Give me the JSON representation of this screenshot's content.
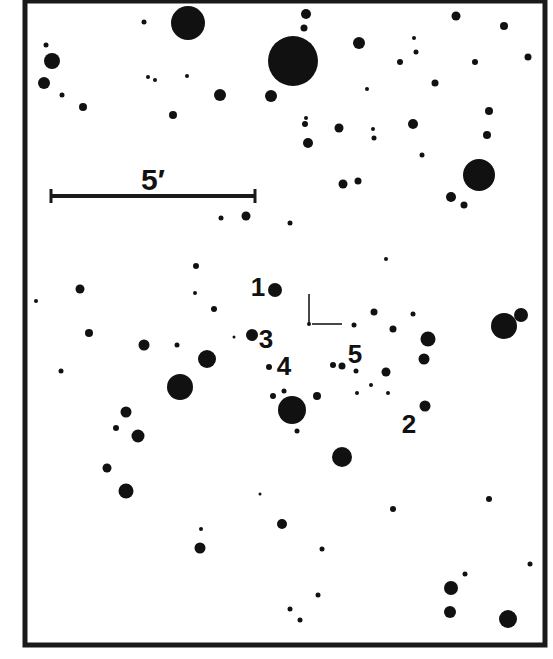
{
  "chart": {
    "type": "finding-chart",
    "frame": {
      "x": 25,
      "y": 1,
      "width": 520,
      "height": 644,
      "stroke": "#1a1a1a",
      "stroke_width": 5
    },
    "scale_bar": {
      "x1": 51,
      "x2": 255,
      "y": 196,
      "label": "5′",
      "label_x": 153,
      "label_y": 190
    },
    "target_marker": {
      "x": 309,
      "y": 324,
      "vertical_len": 30,
      "horizontal_len": 33
    },
    "labels": [
      {
        "text": "1",
        "x": 258,
        "y": 296
      },
      {
        "text": "3",
        "x": 266,
        "y": 348
      },
      {
        "text": "4",
        "x": 284,
        "y": 375
      },
      {
        "text": "5",
        "x": 355,
        "y": 363
      },
      {
        "text": "2",
        "x": 409,
        "y": 433
      }
    ],
    "star_color": "#111111",
    "stars": [
      [
        188,
        23,
        17
      ],
      [
        144,
        22,
        2.5
      ],
      [
        306,
        14,
        5
      ],
      [
        304,
        28,
        3.5
      ],
      [
        293,
        61,
        25
      ],
      [
        46,
        45,
        2.5
      ],
      [
        52,
        61,
        8
      ],
      [
        44,
        83,
        6
      ],
      [
        62,
        95,
        2.5
      ],
      [
        83,
        107,
        4
      ],
      [
        148,
        77,
        2
      ],
      [
        155,
        80,
        2
      ],
      [
        187,
        76,
        2
      ],
      [
        220,
        95,
        6
      ],
      [
        173,
        115,
        4
      ],
      [
        271,
        96,
        6
      ],
      [
        359,
        43,
        6
      ],
      [
        456,
        16,
        4.5
      ],
      [
        504,
        26,
        4
      ],
      [
        414,
        38,
        2
      ],
      [
        416,
        52,
        2.5
      ],
      [
        400,
        62,
        3
      ],
      [
        475,
        62,
        3
      ],
      [
        528,
        57,
        3.5
      ],
      [
        435,
        83,
        3.5
      ],
      [
        367,
        89,
        2
      ],
      [
        306,
        118,
        2
      ],
      [
        305,
        124,
        3
      ],
      [
        339,
        128,
        4.5
      ],
      [
        308,
        143,
        5
      ],
      [
        373,
        129,
        2
      ],
      [
        374,
        138,
        2.5
      ],
      [
        413,
        124,
        5
      ],
      [
        489,
        111,
        4
      ],
      [
        487,
        135,
        4
      ],
      [
        422,
        155,
        2.5
      ],
      [
        479,
        175,
        16
      ],
      [
        451,
        197,
        5
      ],
      [
        464,
        205,
        3.5
      ],
      [
        343,
        184,
        4.5
      ],
      [
        358,
        181,
        3.5
      ],
      [
        221,
        218,
        2.5
      ],
      [
        246,
        216,
        4.5
      ],
      [
        290,
        223,
        2.5
      ],
      [
        196,
        266,
        3
      ],
      [
        80,
        289,
        4.5
      ],
      [
        36,
        301,
        2
      ],
      [
        195,
        293,
        2
      ],
      [
        214,
        309,
        3
      ],
      [
        275,
        290,
        7
      ],
      [
        386,
        259,
        2
      ],
      [
        374,
        312,
        3.5
      ],
      [
        413,
        314,
        2.5
      ],
      [
        393,
        329,
        3.5
      ],
      [
        354,
        325,
        2.5
      ],
      [
        89,
        333,
        4
      ],
      [
        144,
        345,
        5.5
      ],
      [
        177,
        345,
        2.5
      ],
      [
        207,
        359,
        9
      ],
      [
        234,
        337,
        1.5
      ],
      [
        252,
        335,
        6
      ],
      [
        61,
        371,
        2.5
      ],
      [
        180,
        387,
        13
      ],
      [
        269,
        367,
        3
      ],
      [
        273,
        396,
        3
      ],
      [
        284,
        391,
        2.5
      ],
      [
        317,
        396,
        4
      ],
      [
        292,
        410,
        14
      ],
      [
        297,
        431,
        2.5
      ],
      [
        333,
        365,
        3
      ],
      [
        342,
        366,
        3.5
      ],
      [
        356,
        371,
        2.5
      ],
      [
        386,
        372,
        4.5
      ],
      [
        371,
        385,
        2
      ],
      [
        357,
        393,
        2
      ],
      [
        388,
        393,
        2
      ],
      [
        428,
        339,
        7.5
      ],
      [
        424,
        359,
        5.5
      ],
      [
        425,
        406,
        5.5
      ],
      [
        504,
        326,
        13
      ],
      [
        521,
        315,
        7
      ],
      [
        126,
        412,
        5.5
      ],
      [
        116,
        428,
        3
      ],
      [
        138,
        436,
        6.5
      ],
      [
        107,
        468,
        4.5
      ],
      [
        126,
        491,
        7.5
      ],
      [
        342,
        457,
        10
      ],
      [
        260,
        494,
        1.5
      ],
      [
        201,
        529,
        2
      ],
      [
        200,
        548,
        5.5
      ],
      [
        282,
        524,
        5
      ],
      [
        393,
        509,
        3
      ],
      [
        489,
        499,
        3
      ],
      [
        322,
        549,
        2.5
      ],
      [
        530,
        564,
        2.5
      ],
      [
        465,
        574,
        2.5
      ],
      [
        451,
        588,
        7
      ],
      [
        318,
        595,
        2.5
      ],
      [
        290,
        609,
        2.5
      ],
      [
        300,
        620,
        2.5
      ],
      [
        450,
        612,
        6
      ],
      [
        508,
        619,
        9
      ]
    ]
  }
}
